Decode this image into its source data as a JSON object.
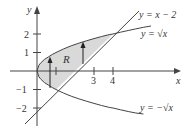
{
  "figure": {
    "type": "region-between-curves",
    "region_label": "R",
    "axes": {
      "x_label": "x",
      "y_label": "y",
      "x_ticks": [
        {
          "value": 1,
          "label": ""
        },
        {
          "value": 3,
          "label": "3"
        },
        {
          "value": 4,
          "label": "4"
        }
      ],
      "y_ticks": [
        {
          "value": 2,
          "label": "2"
        },
        {
          "value": 1,
          "label": "1"
        },
        {
          "value": -1,
          "label": "−1"
        },
        {
          "value": -2,
          "label": "−2"
        }
      ]
    },
    "curves": [
      {
        "name": "line",
        "label": "y = x − 2"
      },
      {
        "name": "upper-root",
        "label": "y = √x"
      },
      {
        "name": "lower-root",
        "label": "y = −√x"
      }
    ],
    "colors": {
      "region_fill": "#d9d9d9",
      "stroke": "#444444",
      "text": "#333333"
    }
  }
}
